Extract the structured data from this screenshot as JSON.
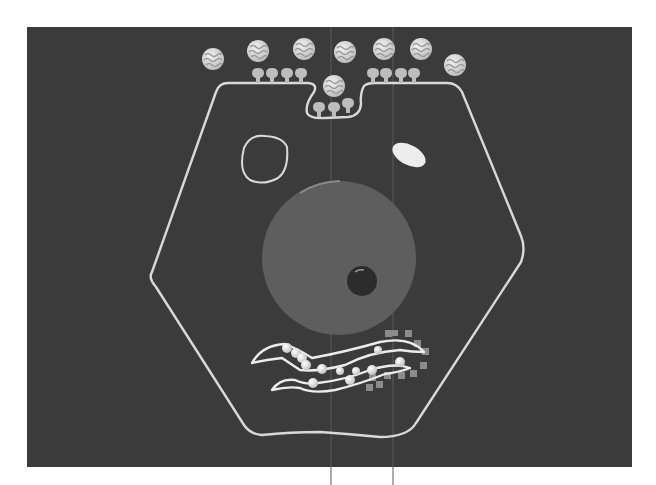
{
  "figure": {
    "title": "Receptor-mediated endocytosis in a cell",
    "background_color": "#3b3b3b",
    "page_color": "#ffffff",
    "line_color": "#d9d9d9"
  },
  "cell": {
    "label": "cell-membrane",
    "components": [
      {
        "id": "extracellular-ligands",
        "count": 7
      },
      {
        "id": "membrane-receptors",
        "count": 11
      },
      {
        "id": "coated-pit-invagination",
        "count": 1
      },
      {
        "id": "internalized-ligand",
        "count": 1
      },
      {
        "id": "vacuole-outline",
        "count": 1
      },
      {
        "id": "white-vesicle",
        "count": 1
      },
      {
        "id": "nucleus",
        "count": 1
      },
      {
        "id": "nucleolus",
        "count": 1
      },
      {
        "id": "endoplasmic-reticulum-with-ribosomes",
        "count": 1
      },
      {
        "id": "golgi-vesicles",
        "count": 12
      }
    ]
  }
}
